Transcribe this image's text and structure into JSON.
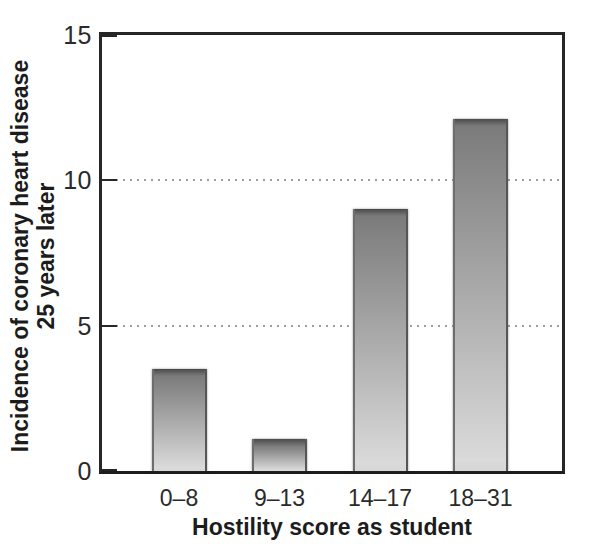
{
  "chart_data": {
    "type": "bar",
    "title": "",
    "xlabel": "Hostility score as student",
    "ylabel": "Incidence of coronary heart disease 25 years later",
    "ylabel_lines": [
      "Incidence of coronary heart disease",
      "25 years later"
    ],
    "categories": [
      "0–8",
      "9–13",
      "14–17",
      "18–31"
    ],
    "values": [
      3.5,
      1.1,
      9.0,
      12.1
    ],
    "ylim": [
      0,
      15
    ],
    "yticks": [
      0,
      5,
      10,
      15
    ],
    "gridlines": [
      5,
      10
    ],
    "grid_style": "dotted",
    "legend_position": "none",
    "colors": {
      "bar_top": "#6f6f6f",
      "bar_bottom": "#d8d8d8",
      "bar_edge": "#565656",
      "frame": "#262626",
      "grid": "#9e9e9e",
      "text": "#1c1c1c",
      "background": "#ffffff"
    }
  }
}
